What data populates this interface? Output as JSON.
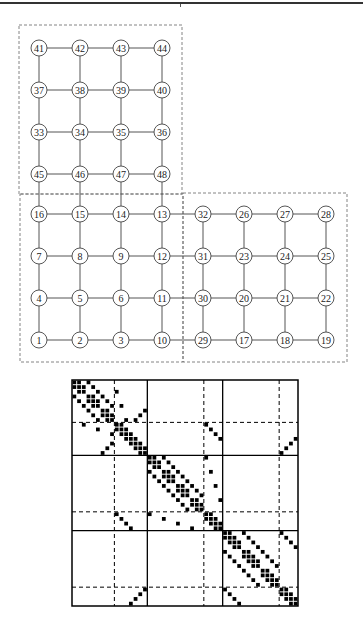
{
  "figure": {
    "type": "grid-graph-with-sparsity-matrix",
    "colors": {
      "line": "#555555",
      "node_stroke": "#444444",
      "text": "#222222",
      "dashed": "#666666",
      "matrix": "#000000"
    }
  },
  "grid": {
    "col_x": [
      39,
      80,
      121,
      162,
      203,
      244,
      285,
      326
    ],
    "row_y": [
      48,
      90,
      132,
      174,
      214,
      256,
      298,
      340
    ],
    "node_radius": 8,
    "rows": [
      [
        41,
        42,
        43,
        44,
        null,
        null,
        null,
        null
      ],
      [
        37,
        38,
        39,
        40,
        null,
        null,
        null,
        null
      ],
      [
        33,
        34,
        35,
        36,
        null,
        null,
        null,
        null
      ],
      [
        45,
        46,
        47,
        48,
        null,
        null,
        null,
        null
      ],
      [
        16,
        15,
        14,
        13,
        32,
        26,
        27,
        28
      ],
      [
        7,
        8,
        9,
        12,
        31,
        23,
        24,
        25
      ],
      [
        4,
        5,
        6,
        11,
        30,
        20,
        21,
        22
      ],
      [
        1,
        2,
        3,
        10,
        29,
        17,
        18,
        19
      ]
    ],
    "subdomain_boxes": [
      {
        "name": "upper-subdomain",
        "x": 19,
        "y": 25,
        "w": 163,
        "h": 169
      },
      {
        "name": "lower-left-subdomain",
        "x": 20,
        "y": 194,
        "w": 163,
        "h": 168
      },
      {
        "name": "lower-right-subdomain",
        "x": 183,
        "y": 193,
        "w": 164,
        "h": 169
      }
    ]
  },
  "matrix": {
    "x": 72,
    "y": 380,
    "size": 226,
    "n": 48,
    "solid_dividers": [
      16,
      32
    ],
    "dashed_dividers": [
      9,
      28,
      44
    ]
  }
}
